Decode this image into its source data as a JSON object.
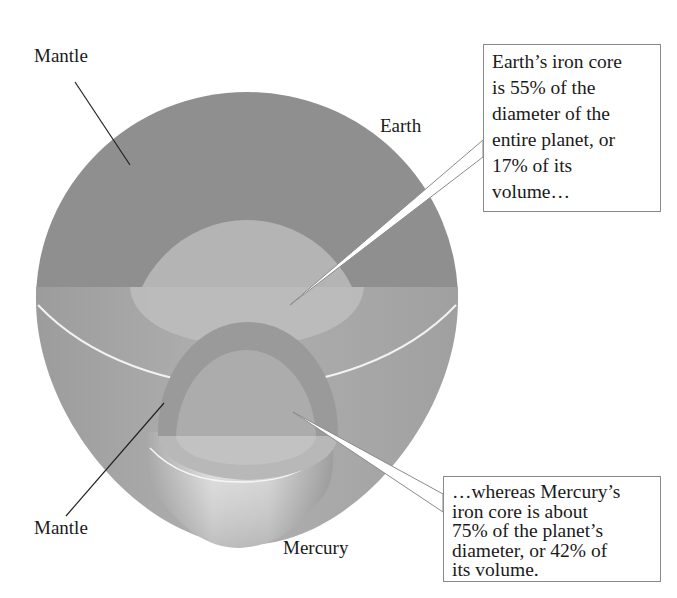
{
  "figure": {
    "labels": {
      "mantle_top": "Mantle",
      "earth": "Earth",
      "mantle_bottom": "Mantle",
      "mercury": "Mercury"
    },
    "callouts": {
      "earth": {
        "lines": [
          "Earth’s iron core",
          "is 55% of the",
          "diameter of the",
          "entire planet, or",
          "17% of its",
          "volume…"
        ]
      },
      "mercury": {
        "lines": [
          "…whereas Mercury’s",
          "iron core is about",
          "75% of the planet’s",
          "diameter, or 42% of",
          "its volume."
        ]
      }
    },
    "colors": {
      "earth_mantle": "#8f8f8f",
      "earth_core": "#b4b4b4",
      "earth_lower": "#a6a6a6",
      "mercury_mantle": "#9a9a9a",
      "mercury_core": "#b0b0b0",
      "callout_border": "#8a8a8a"
    }
  }
}
